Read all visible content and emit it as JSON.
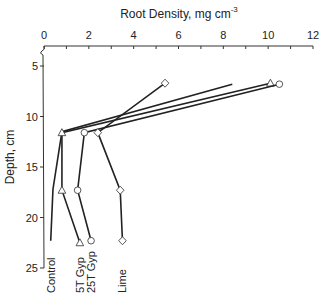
{
  "chart_data": {
    "type": "line",
    "title": "",
    "xlabel": "Root Density, mg cm",
    "xlabel_superscript": "-3",
    "ylabel": "Depth, cm",
    "xlim": [
      0,
      12
    ],
    "ylim": [
      25,
      5
    ],
    "x_ticks": [
      0,
      2,
      4,
      6,
      8,
      10,
      12
    ],
    "y_ticks": [
      5,
      10,
      15,
      20,
      25
    ],
    "x_axis_position": "top",
    "y_axis_inverted": true,
    "grid": false,
    "series": [
      {
        "name": "Control",
        "marker": "none",
        "points": [
          [
            8.4,
            6.8
          ],
          [
            0.8,
            11.5
          ],
          [
            0.4,
            17.2
          ],
          [
            0.3,
            22.3
          ]
        ]
      },
      {
        "name": "5T Gyp",
        "marker": "triangle",
        "points": [
          [
            10.1,
            6.7
          ],
          [
            0.8,
            11.6
          ],
          [
            0.8,
            17.3
          ],
          [
            1.6,
            22.5
          ]
        ]
      },
      {
        "name": "25T Gyp",
        "marker": "circle",
        "points": [
          [
            10.5,
            6.8
          ],
          [
            1.8,
            11.6
          ],
          [
            1.5,
            17.3
          ],
          [
            2.1,
            22.3
          ]
        ]
      },
      {
        "name": "Lime",
        "marker": "diamond",
        "points": [
          [
            5.4,
            6.7
          ],
          [
            2.4,
            11.6
          ],
          [
            3.4,
            17.3
          ],
          [
            3.5,
            22.3
          ]
        ]
      }
    ],
    "legend": "series labels placed vertically beneath last point of each line"
  }
}
